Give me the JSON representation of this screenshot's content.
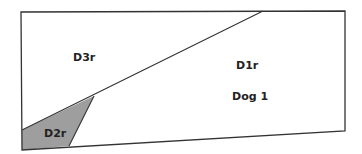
{
  "diagram": {
    "type": "floor-plan-regions",
    "colors": {
      "outline": "#333333",
      "shaded_region": "#9e9e9e",
      "background": "#ffffff"
    },
    "regions": [
      {
        "id": "D3r",
        "label": "D3r"
      },
      {
        "id": "D1r",
        "label": "D1r",
        "sublabel": "Dog 1"
      },
      {
        "id": "D2r",
        "label": "D2r",
        "shaded": true
      }
    ]
  }
}
